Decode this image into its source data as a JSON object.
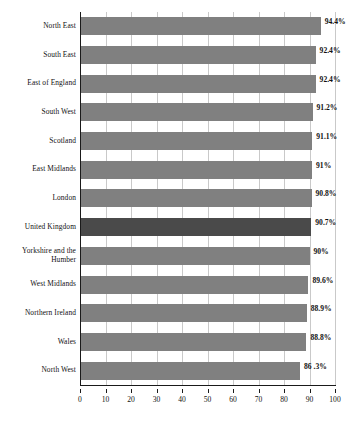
{
  "chart_data": {
    "type": "bar",
    "orientation": "horizontal",
    "title": "",
    "subtitle": "",
    "xlabel": "",
    "ylabel": "",
    "xlim": [
      0,
      100
    ],
    "xticks": [
      0,
      10,
      20,
      30,
      40,
      50,
      60,
      70,
      80,
      90,
      100
    ],
    "grid": true,
    "legend": false,
    "highlight_category": "United Kingdom",
    "colors": {
      "bar": "#808080",
      "bar_highlight": "#4a4a4a",
      "axis": "#1a1a1a",
      "gridline": "#c9c9c9",
      "text": "#111111",
      "background": "#ffffff"
    },
    "categories": [
      "North East",
      "South East",
      "East of England",
      "South West",
      "Scotland",
      "East Midlands",
      "London",
      "United Kingdom",
      "Yorkshire and the Humber",
      "West Midlands",
      "Northern Ireland",
      "Wales",
      "North West"
    ],
    "values": [
      94.4,
      92.4,
      92.4,
      91.2,
      91.1,
      91,
      90.8,
      90.7,
      90,
      89.6,
      88.9,
      88.8,
      86.3
    ],
    "data_labels": [
      "94.4%",
      "92.4%",
      "92.4%",
      "91.2%",
      "91.1%",
      "91%",
      "90.8%",
      "90.7%",
      "90%",
      "89.6%",
      "88.9%",
      "88.8%",
      "86 .3%"
    ],
    "category_label_lines": [
      [
        "North East"
      ],
      [
        "South East"
      ],
      [
        "East of England"
      ],
      [
        "South West"
      ],
      [
        "Scotland"
      ],
      [
        "East Midlands"
      ],
      [
        "London"
      ],
      [
        "United Kingdom"
      ],
      [
        "Yorkshire and the",
        "Humber"
      ],
      [
        "West Midlands"
      ],
      [
        "Northern Ireland"
      ],
      [
        "Wales"
      ],
      [
        "North West"
      ]
    ]
  }
}
